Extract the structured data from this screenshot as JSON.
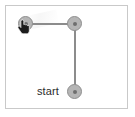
{
  "canvas": {
    "width": 135,
    "height": 117,
    "background_color": "#ffffff",
    "panel_border_color": "#c9c9c9"
  },
  "diagram": {
    "title": "",
    "node_color": "#b5b5b5",
    "node_border_color": "#8f8f8f",
    "edge_color": "#8c8c8c",
    "nodes": [
      {
        "id": "n1",
        "name": "top-left-node",
        "x": 25,
        "y": 23,
        "radius": 8,
        "label": ""
      },
      {
        "id": "n2",
        "name": "corner-node",
        "x": 74,
        "y": 23,
        "radius": 8,
        "label": ""
      },
      {
        "id": "n3",
        "name": "start-node",
        "x": 74,
        "y": 91,
        "radius": 8,
        "label": "start"
      }
    ],
    "edges": [
      {
        "from": "n1",
        "to": "n2",
        "orientation": "horizontal"
      },
      {
        "from": "n2",
        "to": "n3",
        "orientation": "vertical"
      }
    ],
    "labels": [
      {
        "name": "start-label",
        "text": "start",
        "x": 36,
        "y": 85
      }
    ],
    "cursor": {
      "name": "hand-cursor",
      "icon": "pointing-hand-cursor-icon",
      "x": 23,
      "y": 24,
      "color": "#1a1a1a"
    }
  }
}
